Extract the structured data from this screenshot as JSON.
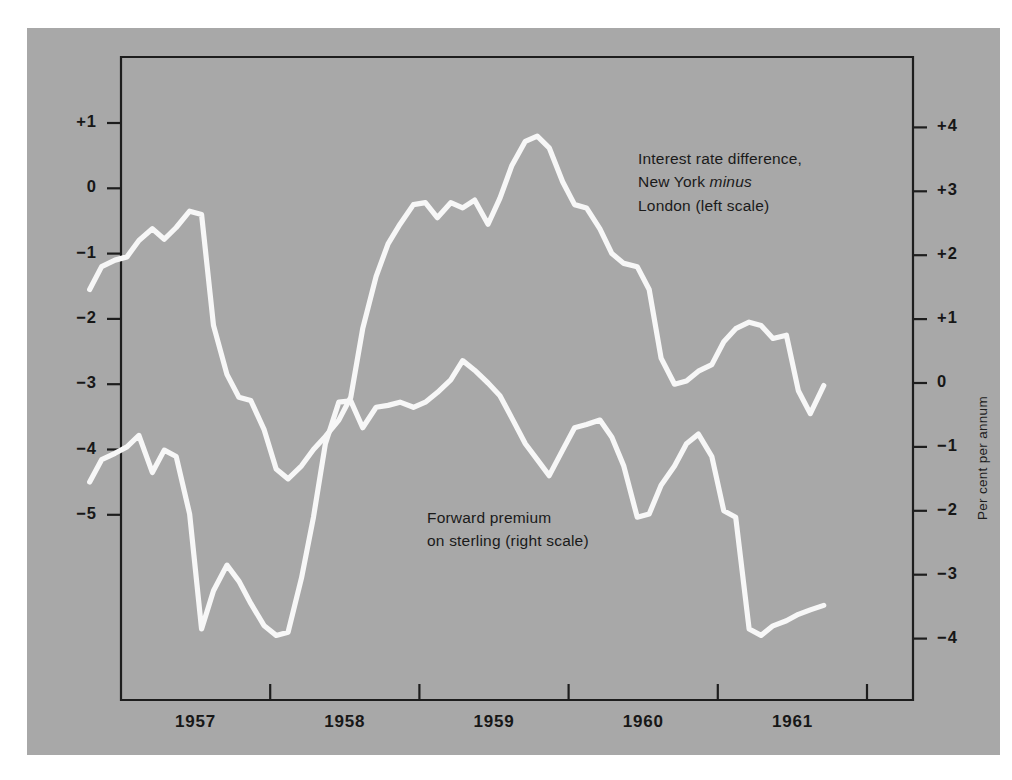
{
  "figure": {
    "background_color": "#ffffff",
    "panel_color": "#a8a8a8",
    "line_color": "#f7f7f7",
    "ink_color": "#171717"
  },
  "annotations": {
    "interest": {
      "line1": "Interest rate difference,",
      "line2_pre": "New York ",
      "line2_em": "minus",
      "line3": "London (left scale)"
    },
    "forward": {
      "line1": "Forward premium",
      "line2": "on sterling (right scale)"
    }
  },
  "axes": {
    "left_title": "Per cent per annum",
    "right_title": "Per cent per annum",
    "left_ticks": [
      "+1",
      "0",
      "−1",
      "−2",
      "−3",
      "−4",
      "−5"
    ],
    "right_ticks": [
      "+4",
      "+3",
      "+2",
      "+1",
      "0",
      "−1",
      "−2",
      "−3",
      "−4"
    ],
    "x_ticks": [
      "1957",
      "1958",
      "1959",
      "1960",
      "1961"
    ]
  },
  "chart_data": {
    "type": "line",
    "title": "",
    "subtitle": "",
    "xlabel": "",
    "ylabel": "Per cent per annum",
    "ylabel_right": "Per cent per annum",
    "grid": false,
    "legend": "inline-annotations",
    "x_tick_labels": [
      "1957",
      "1958",
      "1959",
      "1960",
      "1961"
    ],
    "x_tick_values": [
      1957.0,
      1958.0,
      1959.0,
      1960.0,
      1961.0
    ],
    "xlim": [
      1956.75,
      1961.78
    ],
    "left_axis": {
      "label": "Per cent per annum",
      "ticks": [
        1,
        0,
        -1,
        -2,
        -3,
        -4,
        -5
      ],
      "ylim": [
        -6.0,
        1.25
      ]
    },
    "right_axis": {
      "label": "Per cent per annum",
      "ticks": [
        4,
        3,
        2,
        1,
        0,
        -1,
        -2,
        -3,
        -4
      ],
      "ylim": [
        -4.9,
        4.3
      ],
      "relation_to_left": "right = left + 3 (approximately; axes offset, same unit spacing)"
    },
    "series": [
      {
        "name": "Interest rate difference, New York minus London (left scale)",
        "axis": "left",
        "units": "per cent per annum",
        "x": [
          1956.79,
          1956.87,
          1956.96,
          1957.04,
          1957.12,
          1957.21,
          1957.29,
          1957.37,
          1957.46,
          1957.54,
          1957.62,
          1957.71,
          1957.79,
          1957.87,
          1957.96,
          1958.04,
          1958.12,
          1958.21,
          1958.29,
          1958.37,
          1958.46,
          1958.54,
          1958.62,
          1958.71,
          1958.79,
          1958.87,
          1958.96,
          1959.04,
          1959.12,
          1959.21,
          1959.29,
          1959.37,
          1959.46,
          1959.54,
          1959.62,
          1959.71,
          1959.79,
          1959.87,
          1959.96,
          1960.04,
          1960.12,
          1960.21,
          1960.29,
          1960.37,
          1960.46,
          1960.54,
          1960.62,
          1960.71,
          1960.79,
          1960.87,
          1960.96,
          1961.04,
          1961.12,
          1961.21,
          1961.29,
          1961.37,
          1961.46,
          1961.54,
          1961.62,
          1961.71
        ],
        "y": [
          -1.55,
          -1.2,
          -1.1,
          -1.05,
          -0.8,
          -0.62,
          -0.78,
          -0.6,
          -0.35,
          -0.4,
          -2.1,
          -2.85,
          -3.2,
          -3.25,
          -3.7,
          -4.3,
          -4.45,
          -4.25,
          -4.0,
          -3.8,
          -3.55,
          -3.2,
          -2.15,
          -1.35,
          -0.85,
          -0.55,
          -0.25,
          -0.22,
          -0.45,
          -0.22,
          -0.3,
          -0.18,
          -0.55,
          -0.15,
          0.35,
          0.72,
          0.8,
          0.62,
          0.1,
          -0.25,
          -0.3,
          -0.62,
          -1.0,
          -1.15,
          -1.2,
          -1.55,
          -2.6,
          -3.0,
          -2.95,
          -2.8,
          -2.7,
          -2.35,
          -2.15,
          -2.05,
          -2.1,
          -2.3,
          -2.25,
          -3.1,
          -3.45,
          -3.02
        ]
      },
      {
        "name": "Forward premium on sterling (right scale)",
        "axis": "right",
        "units": "per cent per annum",
        "x": [
          1956.79,
          1956.87,
          1956.96,
          1957.04,
          1957.12,
          1957.21,
          1957.29,
          1957.37,
          1957.46,
          1957.54,
          1957.62,
          1957.71,
          1957.79,
          1957.87,
          1957.96,
          1958.04,
          1958.12,
          1958.21,
          1958.29,
          1958.37,
          1958.46,
          1958.54,
          1958.62,
          1958.71,
          1958.79,
          1958.87,
          1958.96,
          1959.04,
          1959.12,
          1959.21,
          1959.29,
          1959.37,
          1959.46,
          1959.54,
          1959.62,
          1959.71,
          1959.79,
          1959.87,
          1959.96,
          1960.04,
          1960.12,
          1960.21,
          1960.29,
          1960.37,
          1960.46,
          1960.54,
          1960.62,
          1960.71,
          1960.79,
          1960.87,
          1960.96,
          1961.04,
          1961.12,
          1961.21,
          1961.29,
          1961.37,
          1961.46,
          1961.54,
          1961.62,
          1961.71
        ],
        "y": [
          -1.55,
          -1.2,
          -1.1,
          -1.0,
          -0.82,
          -1.4,
          -1.05,
          -1.15,
          -2.05,
          -3.85,
          -3.25,
          -2.85,
          -3.1,
          -3.45,
          -3.8,
          -3.95,
          -3.9,
          -3.05,
          -2.1,
          -0.95,
          -0.3,
          -0.28,
          -0.7,
          -0.38,
          -0.35,
          -0.3,
          -0.38,
          -0.3,
          -0.15,
          0.05,
          0.35,
          0.2,
          0.0,
          -0.2,
          -0.55,
          -0.95,
          -1.2,
          -1.45,
          -1.05,
          -0.7,
          -0.65,
          -0.58,
          -0.85,
          -1.3,
          -2.1,
          -2.05,
          -1.6,
          -1.3,
          -0.95,
          -0.8,
          -1.15,
          -2.0,
          -2.1,
          -3.85,
          -3.95,
          -3.8,
          -3.72,
          -3.62,
          -3.55,
          -3.48
        ]
      }
    ]
  },
  "layout": {
    "plot_left": 121,
    "plot_right": 913,
    "plot_top": 57,
    "plot_bottom": 700,
    "left_y_at_plus1": 123,
    "left_unit_px": 65.3,
    "right_y_at_zero": 383,
    "right_unit_px": 63.9,
    "x_at_1957": 121,
    "x_per_year": 149.2
  }
}
